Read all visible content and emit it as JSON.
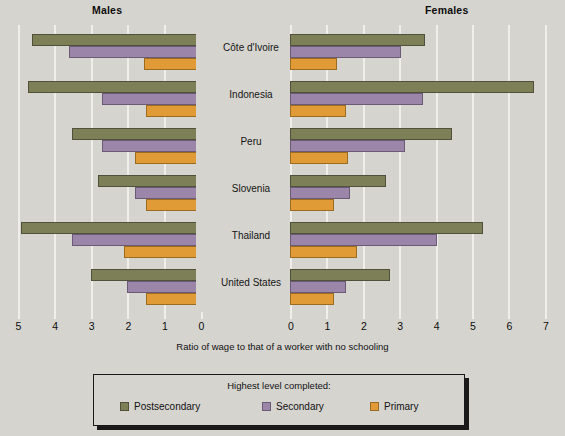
{
  "panels": {
    "left_title": "Males",
    "right_title": "Females"
  },
  "axis": {
    "caption": "Ratio of wage to that of a worker with no schooling",
    "left_ticks": [
      "5",
      "4",
      "3",
      "2",
      "1",
      "0"
    ],
    "right_ticks": [
      "0",
      "1",
      "2",
      "3",
      "4",
      "5",
      "6",
      "7"
    ]
  },
  "legend": {
    "title": "Highest level completed:",
    "items": [
      {
        "label": "Postsecondary",
        "color": "#7d7f56"
      },
      {
        "label": "Secondary",
        "color": "#9b85a8"
      },
      {
        "label": "Primary",
        "color": "#e09a36"
      }
    ]
  },
  "countries": [
    {
      "name": "Côte d'Ivoire"
    },
    {
      "name": "Indonesia"
    },
    {
      "name": "Peru"
    },
    {
      "name": "Slovenia"
    },
    {
      "name": "Thailand"
    },
    {
      "name": "United States"
    }
  ],
  "chart_data": {
    "type": "bar",
    "title": "",
    "subtitle": "",
    "orientation": "horizontal",
    "layout": "back-to-back population pyramid (two mirrored panels)",
    "xlabel": "Ratio of wage to that of a worker with no schooling",
    "ylabel": "",
    "grid": true,
    "legend_position": "bottom",
    "legend_title": "Highest level completed:",
    "panels": [
      "Males",
      "Females"
    ],
    "left_axis_range": [
      5,
      0
    ],
    "right_axis_range": [
      0,
      7
    ],
    "left_axis_ticks": [
      5,
      4,
      3,
      2,
      1,
      0
    ],
    "right_axis_ticks": [
      0,
      1,
      2,
      3,
      4,
      5,
      6,
      7
    ],
    "categories": [
      "Côte d'Ivoire",
      "Indonesia",
      "Peru",
      "Slovenia",
      "Thailand",
      "United States"
    ],
    "series": [
      {
        "name": "Postsecondary",
        "color": "#7d7f56",
        "males": [
          4.6,
          4.7,
          3.5,
          2.8,
          4.9,
          3.0
        ],
        "females": [
          3.7,
          6.7,
          4.45,
          2.65,
          5.3,
          2.75
        ]
      },
      {
        "name": "Secondary",
        "color": "#9b85a8",
        "males": [
          3.6,
          2.7,
          2.7,
          1.8,
          3.5,
          2.0
        ],
        "females": [
          3.05,
          3.65,
          3.15,
          1.65,
          4.05,
          1.55
        ]
      },
      {
        "name": "Primary",
        "color": "#e09a36",
        "males": [
          1.55,
          1.5,
          1.8,
          1.5,
          2.1,
          1.5
        ],
        "females": [
          1.3,
          1.55,
          1.6,
          1.2,
          1.85,
          1.2
        ]
      }
    ]
  }
}
